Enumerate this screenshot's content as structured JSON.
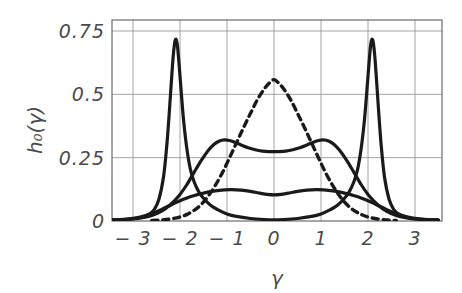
{
  "chart_data": {
    "type": "line",
    "title": "",
    "xlabel": "γ",
    "ylabel": "h₀(γ)",
    "xlim": [
      -3.5,
      3.6
    ],
    "ylim": [
      0,
      0.8
    ],
    "xticks": [
      -3,
      -2,
      -1,
      0,
      1,
      2,
      3
    ],
    "xtick_labels": [
      "-3",
      "-2",
      "-1",
      "0",
      "1",
      "2",
      "3"
    ],
    "yticks": [
      0,
      0.25,
      0.5,
      0.75
    ],
    "ytick_labels": [
      "0",
      "0.25",
      "0.5",
      "0.75"
    ],
    "grid": true,
    "grid_color": "#9a9a9a",
    "frame_color": "#6b6b6b",
    "legend": null,
    "series": [
      {
        "name": "sharp bimodal peaks",
        "style": "solid",
        "color": "#1a1a1a",
        "x": [
          -3.5,
          -3.2,
          -3.0,
          -2.8,
          -2.65,
          -2.55,
          -2.45,
          -2.35,
          -2.28,
          -2.22,
          -2.18,
          -2.14,
          -2.1,
          -2.06,
          -2.02,
          -1.97,
          -1.92,
          -1.85,
          -1.78,
          -1.7,
          -1.6,
          -1.5,
          -1.35,
          -1.2,
          -1.0,
          -0.8,
          -0.5,
          -0.2,
          0,
          0.2,
          0.5,
          0.8,
          1.0,
          1.2,
          1.35,
          1.5,
          1.6,
          1.7,
          1.78,
          1.85,
          1.92,
          1.97,
          2.02,
          2.06,
          2.1,
          2.14,
          2.18,
          2.22,
          2.28,
          2.35,
          2.45,
          2.55,
          2.65,
          2.8,
          3.0,
          3.2,
          3.5
        ],
        "y": [
          0.004,
          0.006,
          0.009,
          0.016,
          0.028,
          0.045,
          0.085,
          0.175,
          0.3,
          0.45,
          0.56,
          0.66,
          0.715,
          0.7,
          0.62,
          0.5,
          0.39,
          0.28,
          0.205,
          0.155,
          0.115,
          0.09,
          0.062,
          0.045,
          0.028,
          0.018,
          0.01,
          0.006,
          0.005,
          0.006,
          0.01,
          0.018,
          0.028,
          0.045,
          0.062,
          0.09,
          0.115,
          0.155,
          0.205,
          0.28,
          0.39,
          0.5,
          0.62,
          0.7,
          0.715,
          0.66,
          0.56,
          0.45,
          0.3,
          0.175,
          0.085,
          0.045,
          0.028,
          0.016,
          0.009,
          0.006,
          0.004
        ]
      },
      {
        "name": "flat-top shouldered",
        "style": "solid",
        "color": "#1a1a1a",
        "x": [
          -3.5,
          -3.2,
          -3.0,
          -2.8,
          -2.6,
          -2.4,
          -2.2,
          -2.0,
          -1.85,
          -1.7,
          -1.55,
          -1.4,
          -1.28,
          -1.16,
          -1.05,
          -0.95,
          -0.85,
          -0.7,
          -0.55,
          -0.4,
          -0.25,
          -0.1,
          0,
          0.1,
          0.25,
          0.4,
          0.55,
          0.7,
          0.85,
          0.95,
          1.05,
          1.16,
          1.28,
          1.4,
          1.55,
          1.7,
          1.85,
          2.0,
          2.2,
          2.4,
          2.6,
          2.8,
          3.0,
          3.2,
          3.5
        ],
        "y": [
          0.003,
          0.005,
          0.008,
          0.013,
          0.022,
          0.038,
          0.065,
          0.105,
          0.145,
          0.192,
          0.238,
          0.278,
          0.302,
          0.316,
          0.32,
          0.318,
          0.312,
          0.3,
          0.289,
          0.281,
          0.276,
          0.274,
          0.274,
          0.274,
          0.276,
          0.281,
          0.289,
          0.3,
          0.312,
          0.318,
          0.32,
          0.316,
          0.302,
          0.278,
          0.238,
          0.192,
          0.145,
          0.105,
          0.065,
          0.038,
          0.022,
          0.013,
          0.008,
          0.005,
          0.003
        ]
      },
      {
        "name": "broad low plateau",
        "style": "solid",
        "color": "#1a1a1a",
        "x": [
          -3.5,
          -3.2,
          -3.0,
          -2.85,
          -2.7,
          -2.55,
          -2.4,
          -2.25,
          -2.1,
          -1.95,
          -1.8,
          -1.65,
          -1.5,
          -1.35,
          -1.2,
          -1.05,
          -0.9,
          -0.7,
          -0.5,
          -0.3,
          -0.15,
          0,
          0.15,
          0.3,
          0.5,
          0.7,
          0.9,
          1.05,
          1.2,
          1.35,
          1.5,
          1.65,
          1.8,
          1.95,
          2.1,
          2.25,
          2.4,
          2.55,
          2.7,
          2.85,
          3.0,
          3.2,
          3.5
        ],
        "y": [
          0.004,
          0.007,
          0.011,
          0.016,
          0.023,
          0.033,
          0.045,
          0.058,
          0.072,
          0.084,
          0.095,
          0.103,
          0.11,
          0.116,
          0.12,
          0.123,
          0.124,
          0.122,
          0.117,
          0.11,
          0.105,
          0.103,
          0.105,
          0.11,
          0.117,
          0.122,
          0.124,
          0.123,
          0.12,
          0.116,
          0.11,
          0.103,
          0.095,
          0.084,
          0.072,
          0.058,
          0.045,
          0.033,
          0.023,
          0.016,
          0.011,
          0.007,
          0.004
        ]
      },
      {
        "name": "dashed unimodal",
        "style": "dashed",
        "color": "#1a1a1a",
        "x": [
          -2.6,
          -2.4,
          -2.2,
          -2.0,
          -1.85,
          -1.7,
          -1.55,
          -1.4,
          -1.25,
          -1.1,
          -0.95,
          -0.8,
          -0.65,
          -0.5,
          -0.35,
          -0.2,
          -0.08,
          0,
          0.08,
          0.2,
          0.35,
          0.5,
          0.65,
          0.8,
          0.95,
          1.1,
          1.25,
          1.4,
          1.55,
          1.7,
          1.85,
          2.0,
          2.2,
          2.4,
          2.6
        ],
        "y": [
          0.002,
          0.004,
          0.008,
          0.016,
          0.026,
          0.042,
          0.065,
          0.098,
          0.14,
          0.19,
          0.248,
          0.308,
          0.368,
          0.425,
          0.48,
          0.523,
          0.548,
          0.558,
          0.548,
          0.523,
          0.48,
          0.425,
          0.368,
          0.308,
          0.248,
          0.19,
          0.14,
          0.098,
          0.065,
          0.042,
          0.026,
          0.016,
          0.008,
          0.004,
          0.002
        ]
      }
    ]
  },
  "axes": {
    "ylabel_text": "h₀(γ)",
    "xlabel_text": "γ"
  }
}
